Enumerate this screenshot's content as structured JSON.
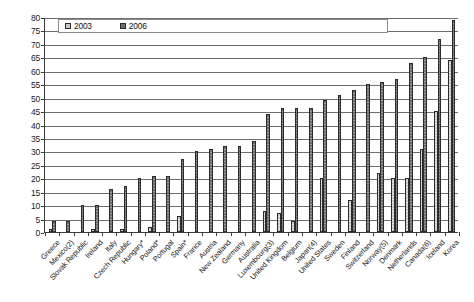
{
  "chart_data": {
    "type": "bar",
    "title": "",
    "xlabel": "",
    "ylabel": "",
    "ylim": [
      0,
      80
    ],
    "ytick_step": 5,
    "yticks": [
      0,
      5,
      10,
      15,
      20,
      25,
      30,
      35,
      40,
      45,
      50,
      55,
      60,
      65,
      70,
      75,
      80
    ],
    "grid": true,
    "legend_position": "top-left",
    "categories": [
      "Greece",
      "Mexico(2)",
      "Slovak Republic",
      "Ireland",
      "Italy",
      "Czech Republic",
      "Hungary*",
      "Poland*",
      "Portugal",
      "Spain*",
      "France",
      "Austria",
      "New Zealand",
      "Germany",
      "Australia",
      "Luxembourg(3)",
      "United Kingdom",
      "Belgium",
      "Japan(4)",
      "United States",
      "Sweden",
      "Finland",
      "Switzerland",
      "Norway(5)",
      "Denmark",
      "Netherlands",
      "Canada(6)",
      "Iceland",
      "Korea"
    ],
    "series": [
      {
        "name": "2003",
        "color": "#c9c9c9",
        "values": [
          1,
          0,
          0,
          1,
          0,
          1,
          0,
          2,
          0,
          6,
          0,
          0,
          0,
          0,
          0,
          8,
          7,
          4,
          0,
          20,
          0,
          12,
          0,
          22,
          20,
          20,
          31,
          45,
          64
        ]
      },
      {
        "name": "2006",
        "color": "#6f6f6f",
        "values": [
          4,
          4,
          10,
          10,
          16,
          17,
          20,
          21,
          21,
          27,
          30,
          31,
          32,
          32,
          34,
          44,
          46,
          46,
          46,
          49,
          51,
          53,
          55,
          56,
          57,
          63,
          65,
          72,
          79
        ]
      }
    ]
  },
  "legend": {
    "entries": [
      {
        "label": "2003"
      },
      {
        "label": "2006"
      }
    ]
  }
}
